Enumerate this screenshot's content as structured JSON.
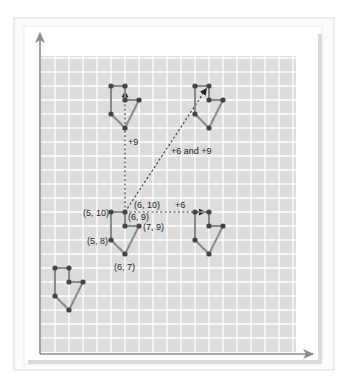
{
  "diagram": {
    "colors": {
      "frame_border": "#e6e6e6",
      "panel_fill": "#f4f4f4",
      "panel_border": "#d9d9d9",
      "grid_fill": "#dcdcdc",
      "grid_line": "#ffffff",
      "axis": "#8c8c8c",
      "shape_edge": "#8a8a8a",
      "vertex": "#444444",
      "arrow": "#333333",
      "label": "#222222"
    },
    "grid": {
      "origin_px": [
        41,
        352
      ],
      "unit_px": 14,
      "x_units": 18,
      "y_units": 21
    },
    "axes": {
      "x_axis_tip_px": [
        313,
        354
      ],
      "y_axis_tip_px": [
        40,
        33
      ]
    },
    "original_shape": {
      "name": "original",
      "vertices": [
        [
          5,
          10
        ],
        [
          6,
          10
        ],
        [
          6,
          9
        ],
        [
          7,
          9
        ],
        [
          6,
          7
        ],
        [
          5,
          8
        ]
      ],
      "point_labels": [
        {
          "text": "(5, 10)",
          "at": [
            5,
            10
          ],
          "dx": -28,
          "dy": 4
        },
        {
          "text": "(6, 10)",
          "at": [
            6,
            10
          ],
          "dx": 9,
          "dy": -4
        },
        {
          "text": "(6, 9)",
          "at": [
            6,
            9
          ],
          "dx": 3,
          "dy": -6
        },
        {
          "text": "(7, 9)",
          "at": [
            7,
            9
          ],
          "dx": 4,
          "dy": 4
        },
        {
          "text": "(5, 8)",
          "at": [
            5,
            8
          ],
          "dx": -24,
          "dy": 4
        },
        {
          "text": "(6, 7)",
          "at": [
            6,
            7
          ],
          "dx": -11,
          "dy": 16
        }
      ]
    },
    "translated_shapes": [
      {
        "name": "translated-up-9",
        "offset": [
          0,
          9
        ]
      },
      {
        "name": "translated-right-6-up-9",
        "offset": [
          6,
          9
        ]
      },
      {
        "name": "translated-right-6",
        "offset": [
          6,
          0
        ]
      },
      {
        "name": "translated-left-4-down-4",
        "offset": [
          -4,
          -4
        ]
      }
    ],
    "arrows": [
      {
        "name": "arrow-up-9",
        "from": [
          6,
          10
        ],
        "to": [
          6,
          18.6
        ],
        "label": "+9",
        "label_px": [
          128,
          145
        ]
      },
      {
        "name": "arrow-diagonal",
        "from": [
          6,
          10
        ],
        "to": [
          11.8,
          18.8
        ],
        "label": "+6 and +9",
        "label_px": [
          171,
          154
        ]
      },
      {
        "name": "arrow-right-6",
        "from": [
          6,
          10
        ],
        "to": [
          11.7,
          10
        ],
        "label": "+6",
        "label_px": [
          175,
          208
        ]
      }
    ]
  }
}
